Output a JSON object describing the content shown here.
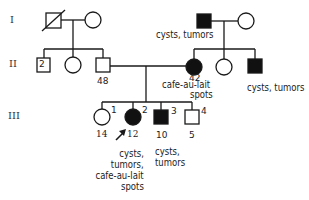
{
  "generations": [
    "I",
    "II",
    "III"
  ],
  "individuals": {
    "I1": {
      "sex": "male",
      "affected": false,
      "deceased": true
    },
    "I2": {
      "sex": "female",
      "affected": false
    },
    "I3": {
      "sex": "male",
      "affected": true,
      "note": "cysts, tumors"
    },
    "I4": {
      "sex": "female",
      "affected": false
    },
    "II1": {
      "sex": "male",
      "affected": false,
      "count": "2"
    },
    "II2": {
      "sex": "female",
      "affected": false
    },
    "II3": {
      "sex": "male",
      "affected": false,
      "age": "48"
    },
    "II4": {
      "sex": "female",
      "affected": true,
      "age": "42",
      "note_line1": "cafe-au-lait",
      "note_line2": "spots"
    },
    "II5": {
      "sex": "female",
      "affected": false
    },
    "II6": {
      "sex": "male",
      "affected": true,
      "note": "cysts, tumors"
    },
    "III1": {
      "sex": "female",
      "affected": false,
      "index": "1",
      "age": "14"
    },
    "III2": {
      "sex": "female",
      "affected": true,
      "proband": true,
      "index": "2",
      "age": "12",
      "note_lines": [
        "cysts,",
        "tumors,",
        "cafe-au-lait",
        "spots"
      ]
    },
    "III3": {
      "sex": "male",
      "affected": true,
      "index": "3",
      "age": "10",
      "note_lines": [
        "cysts,",
        "tumors"
      ]
    },
    "III4": {
      "sex": "male",
      "affected": false,
      "index": "4",
      "age": "5"
    }
  },
  "colors": {
    "line": "#1a1a1a",
    "affected_fill": "#111111",
    "unaffected_fill": "#ffffff"
  }
}
